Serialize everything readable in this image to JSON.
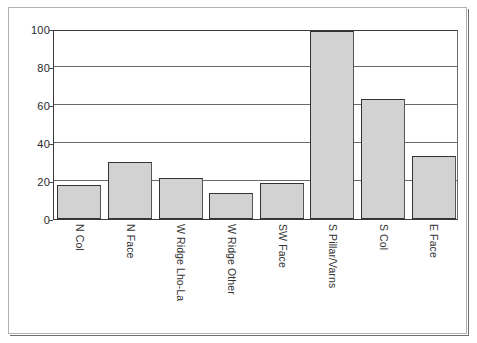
{
  "chart_data": {
    "type": "bar",
    "title": "",
    "subtitle": "",
    "xlabel": "",
    "ylabel": "",
    "categories": [
      "N Col",
      "N Face",
      "W Ridge Lho-La",
      "W Ridge Other",
      "SW Face",
      "S Pillar/Varns",
      "S Col",
      "E Face"
    ],
    "values": [
      18,
      30,
      21.5,
      13.5,
      19,
      99,
      63,
      33
    ],
    "ylim": [
      0,
      100
    ],
    "ytick_labels": [
      "100",
      "80",
      "60",
      "40",
      "20",
      "0"
    ],
    "ytick_values": [
      100,
      80,
      60,
      40,
      20,
      0
    ],
    "grid": "horizontal",
    "legend": "none",
    "series": [
      {
        "name": "",
        "values": [
          18,
          30,
          21.5,
          13.5,
          19,
          99,
          63,
          33
        ]
      }
    ],
    "colors": {
      "bar_fill": "#d2d2d2",
      "bar_border": "#333333",
      "gridline": "#6b6b6b",
      "axis": "#3a3a3a",
      "plot_background": "#ffffff",
      "frame_border": "#b0b0b0",
      "text": "#333333"
    }
  }
}
